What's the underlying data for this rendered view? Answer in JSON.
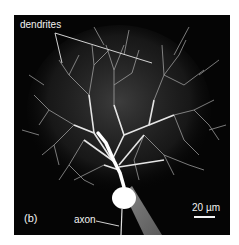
{
  "figure": {
    "panel_label": "(b)",
    "annotations": {
      "dendrites": "dendrites",
      "axon": "axon"
    },
    "scale_bar": {
      "label": "20 µm",
      "value": 20,
      "unit": "µm"
    },
    "colors": {
      "background": "#050505",
      "cell": "#ffffff",
      "annotation": "#f2f2f2",
      "page": "#ffffff"
    }
  }
}
